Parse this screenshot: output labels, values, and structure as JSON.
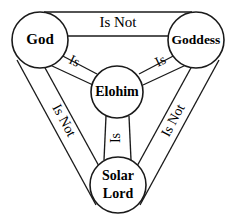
{
  "diagram": {
    "type": "relationship-shield",
    "background_color": "#ffffff",
    "stroke_color": "#1a1a1a",
    "text_color": "#000000",
    "nodes": [
      {
        "id": "god",
        "label": "God",
        "position": "top-left",
        "cx": 40,
        "cy": 40,
        "r": 28
      },
      {
        "id": "goddess",
        "label": "Goddess",
        "position": "top-right",
        "cx": 196,
        "cy": 40,
        "r": 28
      },
      {
        "id": "elohim",
        "label": "Elohim",
        "position": "center",
        "cx": 117,
        "cy": 92,
        "r": 26
      },
      {
        "id": "solar_lord",
        "label_line1": "Solar",
        "label_line2": "Lord",
        "label": "Solar Lord",
        "position": "bottom",
        "cx": 118,
        "cy": 185,
        "r": 28
      }
    ],
    "edges": [
      {
        "id": "god-goddess",
        "from": "God",
        "to": "Goddess",
        "label": "Is Not",
        "orientation": "horizontal-top"
      },
      {
        "id": "god-solarlord",
        "from": "God",
        "to": "Solar Lord",
        "label": "Is Not",
        "orientation": "diagonal-left"
      },
      {
        "id": "goddess-solarlord",
        "from": "Goddess",
        "to": "Solar Lord",
        "label": "Is Not",
        "orientation": "diagonal-right"
      },
      {
        "id": "god-elohim",
        "from": "God",
        "to": "Elohim",
        "label": "Is",
        "orientation": "spoke-upper-left"
      },
      {
        "id": "goddess-elohim",
        "from": "Goddess",
        "to": "Elohim",
        "label": "Is",
        "orientation": "spoke-upper-right"
      },
      {
        "id": "solarlord-elohim",
        "from": "Solar Lord",
        "to": "Elohim",
        "label": "Is",
        "orientation": "spoke-vertical"
      }
    ]
  }
}
